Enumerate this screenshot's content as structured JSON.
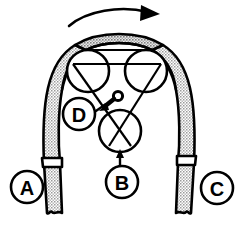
{
  "figure": {
    "kind": "mechanical-diagram",
    "background_color": "#ffffff",
    "line_color": "#000000",
    "belt_fill_color": "#c8c8c8",
    "width": 239,
    "height": 229
  },
  "rotation_arrow": {
    "name": "rotation-direction-arrow",
    "direction": "clockwise",
    "label": ""
  },
  "callouts": [
    {
      "id": "A",
      "label": "A",
      "cx": 27,
      "cy": 187,
      "r": 16,
      "target": "left-belt-run"
    },
    {
      "id": "B",
      "label": "B",
      "cx": 122,
      "cy": 182,
      "r": 16,
      "target": "lower-pulley"
    },
    {
      "id": "C",
      "label": "C",
      "cx": 217,
      "cy": 188,
      "r": 16,
      "target": "right-belt-run"
    },
    {
      "id": "D",
      "label": "D",
      "cx": 79,
      "cy": 114,
      "r": 16,
      "target": "tensioner-pin"
    }
  ],
  "pulleys": [
    {
      "id": "left-pulley",
      "cx": 88,
      "cy": 71,
      "r": 21
    },
    {
      "id": "right-pulley",
      "cx": 146,
      "cy": 71,
      "r": 21
    },
    {
      "id": "lower-pulley",
      "cx": 120,
      "cy": 131,
      "r": 21
    }
  ],
  "belt": {
    "name": "drive-belt",
    "description": "thick stippled band looping over the upper pulleys and down both legs",
    "left_leg_collar_y": 163,
    "right_leg_collar_y": 161
  },
  "tensioner": {
    "name": "tensioner-pin",
    "pin_cx": 118,
    "pin_cy": 96,
    "pin_r": 4
  }
}
